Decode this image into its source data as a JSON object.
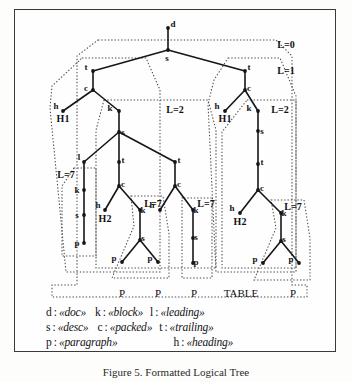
{
  "figure": {
    "caption": "Figure 5.  Formatted Logical Tree",
    "frame_color": "#3a3a3a"
  },
  "chart_data": {
    "type": "diagram",
    "title": "Formatted Logical Tree",
    "node_symbols": [
      "d",
      "s",
      "t",
      "c",
      "h",
      "k",
      "l",
      "p"
    ],
    "nodes": [
      {
        "id": "n0",
        "label": "d",
        "x": 168,
        "y": 28,
        "label_dx": 5,
        "label_dy": -1
      },
      {
        "id": "n1",
        "label": "s",
        "x": 168,
        "y": 50,
        "label_dx": -1,
        "label_dy": 11
      },
      {
        "id": "n2",
        "label": "t",
        "x": 93,
        "y": 71,
        "label_dx": -7,
        "label_dy": -1
      },
      {
        "id": "n3",
        "label": "c",
        "x": 93,
        "y": 90,
        "label_dx": -7,
        "label_dy": 1
      },
      {
        "id": "n4",
        "label": "h",
        "x": 63,
        "y": 111,
        "label_dx": -7,
        "label_dy": -2
      },
      {
        "id": "n5",
        "label": "k",
        "x": 119,
        "y": 111,
        "label_dx": -9,
        "label_dy": 0
      },
      {
        "id": "n6",
        "label": "s",
        "x": 119,
        "y": 132,
        "label_dx": 4,
        "label_dy": 3
      },
      {
        "id": "n7",
        "label": "l",
        "x": 84,
        "y": 162,
        "label_dx": -5,
        "label_dy": -2
      },
      {
        "id": "n8",
        "label": "k",
        "x": 84,
        "y": 190,
        "label_dx": -7,
        "label_dy": 3
      },
      {
        "id": "n9",
        "label": "s",
        "x": 84,
        "y": 215,
        "label_dx": -7,
        "label_dy": 3
      },
      {
        "id": "n10",
        "label": "p",
        "x": 84,
        "y": 243,
        "label_dx": -7,
        "label_dy": 3
      },
      {
        "id": "n11",
        "label": "t",
        "x": 119,
        "y": 162,
        "label_dx": 4,
        "label_dy": 1
      },
      {
        "id": "n12",
        "label": "c",
        "x": 119,
        "y": 186,
        "label_dx": 4,
        "label_dy": 1
      },
      {
        "id": "n13",
        "label": "h",
        "x": 105,
        "y": 210,
        "label_dx": -7,
        "label_dy": -2
      },
      {
        "id": "n14",
        "label": "k",
        "x": 140,
        "y": 210,
        "label_dx": 3,
        "label_dy": 3
      },
      {
        "id": "n15",
        "label": "s",
        "x": 140,
        "y": 240,
        "label_dx": 3,
        "label_dy": 1
      },
      {
        "id": "n16",
        "label": "p",
        "x": 122,
        "y": 262,
        "label_dx": -8,
        "label_dy": -1
      },
      {
        "id": "n17",
        "label": "p",
        "x": 158,
        "y": 262,
        "label_dx": -8,
        "label_dy": -1
      },
      {
        "id": "n18",
        "label": "t",
        "x": 175,
        "y": 162,
        "label_dx": 4,
        "label_dy": 1
      },
      {
        "id": "n19",
        "label": "c",
        "x": 175,
        "y": 186,
        "label_dx": 4,
        "label_dy": 1
      },
      {
        "id": "n20",
        "label": "h",
        "x": 160,
        "y": 210,
        "label_dx": -8,
        "label_dy": -2
      },
      {
        "id": "n21",
        "label": "k",
        "x": 193,
        "y": 210,
        "label_dx": 3,
        "label_dy": 3
      },
      {
        "id": "n22",
        "label": "s",
        "x": 193,
        "y": 238,
        "label_dx": 3,
        "label_dy": 2
      },
      {
        "id": "n23",
        "label": "p",
        "x": 193,
        "y": 263,
        "label_dx": 3,
        "label_dy": 2
      },
      {
        "id": "n24",
        "label": "t",
        "x": 245,
        "y": 71,
        "label_dx": 4,
        "label_dy": -1
      },
      {
        "id": "n25",
        "label": "c",
        "x": 245,
        "y": 90,
        "label_dx": 4,
        "label_dy": 1
      },
      {
        "id": "n26",
        "label": "h",
        "x": 225,
        "y": 111,
        "label_dx": -8,
        "label_dy": -2
      },
      {
        "id": "n27",
        "label": "k",
        "x": 258,
        "y": 111,
        "label_dx": -9,
        "label_dy": 0
      },
      {
        "id": "n28",
        "label": "s",
        "x": 258,
        "y": 131,
        "label_dx": 4,
        "label_dy": 3
      },
      {
        "id": "n29",
        "label": "t",
        "x": 258,
        "y": 164,
        "label_dx": 4,
        "label_dy": 1
      },
      {
        "id": "n30",
        "label": "c",
        "x": 258,
        "y": 190,
        "label_dx": 4,
        "label_dy": 1
      },
      {
        "id": "n31",
        "label": "h",
        "x": 240,
        "y": 213,
        "label_dx": -8,
        "label_dy": -2
      },
      {
        "id": "n32",
        "label": "k",
        "x": 281,
        "y": 213,
        "label_dx": 3,
        "label_dy": 3
      },
      {
        "id": "n33",
        "label": "s",
        "x": 281,
        "y": 241,
        "label_dx": 3,
        "label_dy": 1
      },
      {
        "id": "n34",
        "label": "p",
        "x": 263,
        "y": 263,
        "label_dx": -8,
        "label_dy": -1
      },
      {
        "id": "n35",
        "label": "p",
        "x": 299,
        "y": 263,
        "label_dx": -8,
        "label_dy": -1
      }
    ],
    "edges": [
      [
        "n0",
        "n1"
      ],
      [
        "n1",
        "n2"
      ],
      [
        "n1",
        "n24"
      ],
      [
        "n2",
        "n3"
      ],
      [
        "n3",
        "n4"
      ],
      [
        "n3",
        "n5"
      ],
      [
        "n5",
        "n6"
      ],
      [
        "n6",
        "n7"
      ],
      [
        "n6",
        "n11"
      ],
      [
        "n6",
        "n18"
      ],
      [
        "n7",
        "n8"
      ],
      [
        "n8",
        "n9"
      ],
      [
        "n9",
        "n10"
      ],
      [
        "n11",
        "n12"
      ],
      [
        "n12",
        "n13"
      ],
      [
        "n12",
        "n14"
      ],
      [
        "n14",
        "n15"
      ],
      [
        "n15",
        "n16"
      ],
      [
        "n15",
        "n17"
      ],
      [
        "n18",
        "n19"
      ],
      [
        "n19",
        "n20"
      ],
      [
        "n19",
        "n21"
      ],
      [
        "n21",
        "n22"
      ],
      [
        "n22",
        "n23"
      ],
      [
        "n24",
        "n25"
      ],
      [
        "n25",
        "n26"
      ],
      [
        "n25",
        "n27"
      ],
      [
        "n27",
        "n28"
      ],
      [
        "n28",
        "n29"
      ],
      [
        "n29",
        "n30"
      ],
      [
        "n30",
        "n31"
      ],
      [
        "n30",
        "n32"
      ],
      [
        "n32",
        "n33"
      ],
      [
        "n33",
        "n34"
      ],
      [
        "n33",
        "n35"
      ]
    ],
    "leaf_labels": [
      {
        "text": "H1",
        "x": 63,
        "y": 122
      },
      {
        "text": "H2",
        "x": 105,
        "y": 222
      },
      {
        "text": "H1",
        "x": 225,
        "y": 122
      },
      {
        "text": "H2",
        "x": 240,
        "y": 225
      }
    ],
    "region_labels": [
      {
        "text": "L=0",
        "x": 286,
        "y": 48
      },
      {
        "text": "L=1",
        "x": 286,
        "y": 74
      },
      {
        "text": "L=2",
        "x": 175,
        "y": 113
      },
      {
        "text": "L=2",
        "x": 280,
        "y": 113
      },
      {
        "text": "L=7",
        "x": 66,
        "y": 178
      },
      {
        "text": "L=7",
        "x": 153,
        "y": 207
      },
      {
        "text": "L=7",
        "x": 206,
        "y": 207
      },
      {
        "text": "L=7",
        "x": 293,
        "y": 210
      }
    ],
    "regions": [
      {
        "name": "region-L0",
        "points": "98,40 276,40 292,56 292,285 307,285 307,297 52,297 52,285 77,285 77,56 98,40"
      },
      {
        "name": "region-L1-left",
        "points": "82,58 146,58 160,90 160,272 66,272 50,108 52,86 82,58"
      },
      {
        "name": "region-L1-right",
        "points": "228,58 280,58 296,96 296,272 216,272 208,104 214,80 228,58"
      },
      {
        "name": "region-L2-left",
        "points": "104,100 208,100 216,130 216,268 96,268 96,130 104,100"
      },
      {
        "name": "region-L2-right",
        "points": "247,100 296,100 296,268 222,268 222,132 247,100"
      },
      {
        "name": "region-L7-a",
        "points": "74,168 96,168 96,256 62,256 62,186 74,168"
      },
      {
        "name": "region-L7-b",
        "points": "131,196 163,196 169,234 169,278 112,278 134,226 131,196"
      },
      {
        "name": "region-L7-c",
        "points": "184,198 212,198 212,278 182,278 182,198 184,198"
      },
      {
        "name": "region-L7-d",
        "points": "271,200 304,200 310,238 310,280 254,280 276,228 271,200"
      }
    ],
    "bottom_labels": [
      {
        "text": "P",
        "x": 122
      },
      {
        "text": "P",
        "x": 158
      },
      {
        "text": "P",
        "x": 194
      },
      {
        "text": "TABLE",
        "x": 241
      },
      {
        "text": "P",
        "x": 293
      }
    ],
    "bottom_labels_y": 297
  },
  "legend": {
    "rows": [
      [
        {
          "key": "d",
          "value": "doc"
        },
        {
          "key": "k",
          "value": "block"
        },
        {
          "key": "l",
          "value": "leading"
        }
      ],
      [
        {
          "key": "s",
          "value": "desc"
        },
        {
          "key": "c",
          "value": "packed"
        },
        {
          "key": "t",
          "value": "trailing"
        }
      ],
      [
        {
          "key": "p",
          "value": "paragraph"
        },
        {
          "key": "h",
          "value": "heading"
        }
      ]
    ],
    "separator": ":",
    "open_guillemet": "«",
    "close_guillemet": "»"
  }
}
